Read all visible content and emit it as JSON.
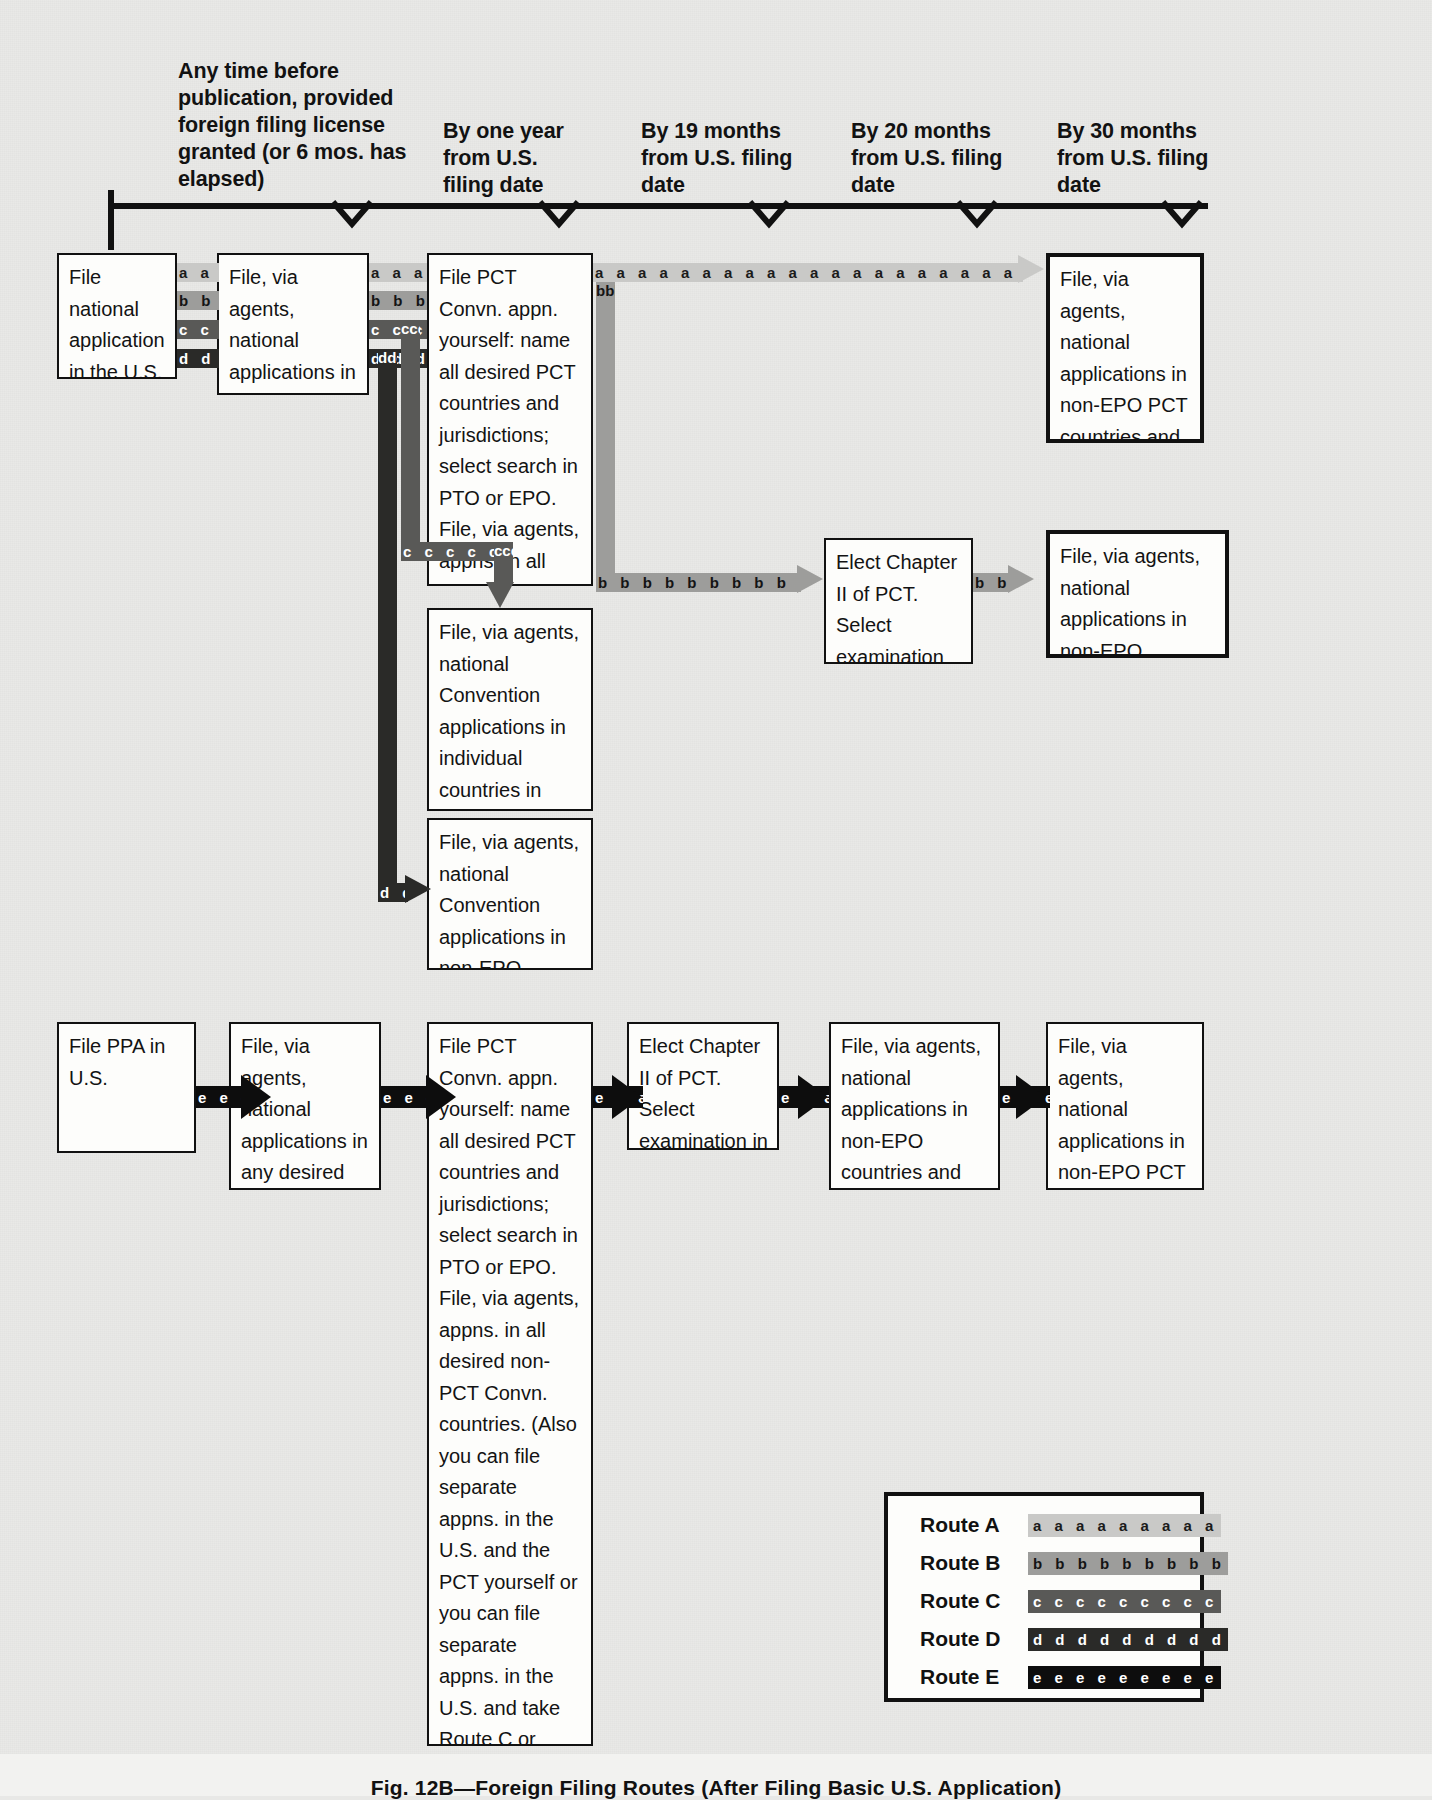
{
  "figure": {
    "caption": "Fig. 12B—Foreign Filing Routes (After Filing Basic U.S. Application)"
  },
  "timeline": {
    "milestones": [
      {
        "id": "m1",
        "text": "Any time before publication, provided foreign filing license granted (or 6 mos. has elapsed)"
      },
      {
        "id": "m2",
        "text": "By one year from U.S. filing date"
      },
      {
        "id": "m3",
        "text": "By 19 months from U.S. filing date"
      },
      {
        "id": "m4",
        "text": "By 20 months from U.S. filing date"
      },
      {
        "id": "m5",
        "text": "By 30 months from U.S. filing date"
      }
    ]
  },
  "boxes": {
    "file_national_us": "File national application in the U.S. PTO",
    "file_agents_nonconvention": "File, via agents, national applications in any desired non-Convention countries",
    "file_pct_convn": "File PCT Convn. appn. yourself: name all desired PCT countries and jurisdictions; select search in PTO or EPO. File, via agents, appns. in all desired non-PCT Convn. countries",
    "file_nonepo_pct_epo": "File, via agents, national applications in non-EPO PCT countries and the EPO",
    "file_convention_individual": "File, via agents, national Convention applications in individual countries in Europe and elsewhere",
    "file_convention_nonepo": "File, via agents, national Convention applications in non-EPO countries and the EPO",
    "elect_chapter2_top": "Elect Chapter II of PCT. Select examination in PTO or EPO",
    "file_nonepo_epo_top": "File, via agents, national applications in non-EPO countries and the EPO",
    "file_ppa_us": "File PPA in U.S.",
    "file_agents_nonconvention_b": "File, via agents, national applications in any desired non-Convention countries",
    "file_pct_convn_b": "File PCT Convn. appn. yourself: name all desired PCT countries and jurisdictions; select search in PTO or EPO. File, via agents, appns. in all desired non-PCT Convn. countries. (Also you can file separate appns. in the U.S. and the PCT yourself or you can file separate appns. in the U.S. and take Route C or Route D)",
    "elect_chapter2_bottom": "Elect Chapter II of PCT. Select examination in PTO or EPO",
    "file_nonepo_epo_bottom": "File, via agents, national applications in non-EPO countries and the EPO. File U.S. appn. yourself",
    "file_nonepo_pct_epo_bottom": "File, via agents, national applications in non-EPO PCT countries and the EPO"
  },
  "legend": {
    "rows": [
      {
        "label": "Route A",
        "letter": "a",
        "swatch": "a a a a a a a a a",
        "color": "#c9c9c7"
      },
      {
        "label": "Route B",
        "letter": "b",
        "swatch": "b b b b b b b b b",
        "color": "#9d9d9b"
      },
      {
        "label": "Route C",
        "letter": "c",
        "swatch": "c c c c c c c c c",
        "color": "#595957"
      },
      {
        "label": "Route D",
        "letter": "d",
        "swatch": "d d d d d d d d d",
        "color": "#2a2a28"
      },
      {
        "label": "Route E",
        "letter": "e",
        "swatch": "e e e e e e e e e",
        "color": "#0d0d0d"
      }
    ]
  },
  "connectors": {
    "a_short": "a a a a",
    "a_long": "a a a a a a a a a a a a a a a a a a a a a a a a a a a a a a a a a a a a a a a a a a a a",
    "b_short": "b b b b",
    "b_mid": "b b b b b b b b  b b b b b b b",
    "b_tiny": "b b b",
    "b_vert": "bbbbbbbbbbbbbbbbbb",
    "c_short": "c c c c",
    "c_horiz": "c c c c c c c c c",
    "c_vert": "cccccccccccccccccccccccc",
    "c_vert_short": "ccccccccc",
    "d_short": "d d d d",
    "d_vert": "dddddddddddddddddddddddddddddddddddddddddddddd",
    "d_tiny": "d d",
    "e_short": "e e e e"
  }
}
